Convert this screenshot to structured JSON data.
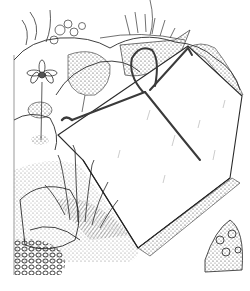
{
  "illustration": {
    "subject": "pen-and-ink drawing of a pane of glass propped at an angle over alpine rock-garden plants, held by a bent wire hoop",
    "style": "black line art on white",
    "colors": {
      "background": "#ffffff",
      "ink": "#2a2a2a",
      "wire": "#3a3a3a",
      "shade": "#777777"
    }
  }
}
